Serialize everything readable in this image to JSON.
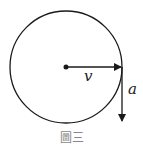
{
  "diagram": {
    "circle": {
      "cx": 66,
      "cy": 67,
      "r": 56
    },
    "velocity": {
      "label": "v",
      "x1": 66,
      "y1": 67,
      "x2": 122,
      "y2": 67
    },
    "acceleration": {
      "label": "a",
      "x1": 122,
      "y1": 67,
      "x2": 122,
      "y2": 122
    },
    "caption": "圖三",
    "colors": {
      "stroke": "#1a1a1a",
      "caption": "#888888"
    }
  }
}
